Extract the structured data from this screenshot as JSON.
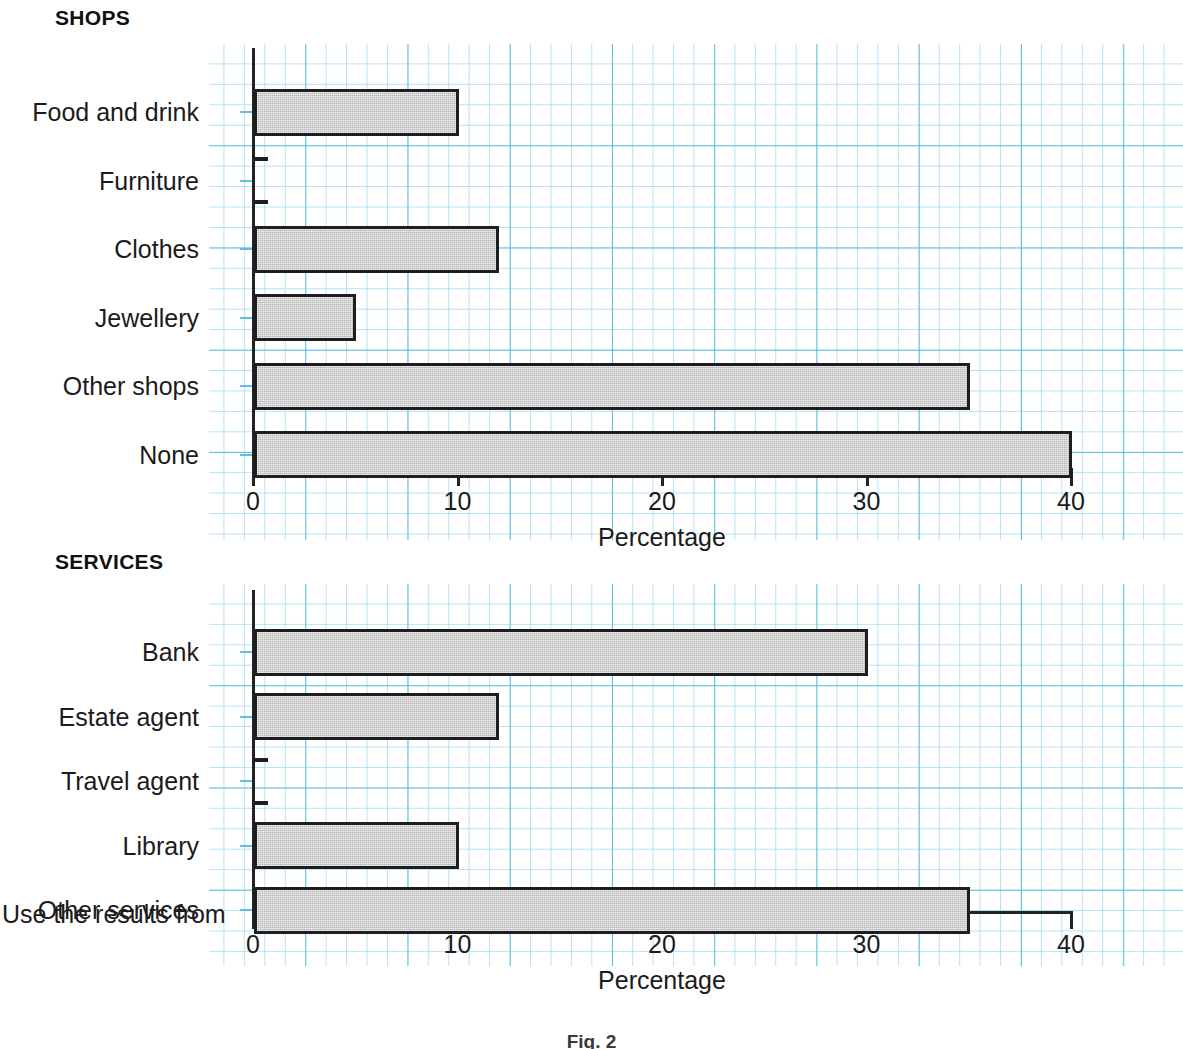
{
  "figure": {
    "caption": "Fig. 2",
    "stray_text": "Use the results from"
  },
  "shops": {
    "title": "SHOPS",
    "axis_caption": "Percentage"
  },
  "services": {
    "title": "SERVICES",
    "axis_caption": "Percentage"
  },
  "chart_data": [
    {
      "type": "bar",
      "orientation": "horizontal",
      "title": "SHOPS",
      "xlabel": "Percentage",
      "ylabel": "",
      "xlim": [
        0,
        45
      ],
      "xticks": [
        0,
        10,
        20,
        30,
        40
      ],
      "xticklabels": [
        "0",
        "10",
        "20",
        "30",
        "40"
      ],
      "grid": true,
      "grid_minor_step": 1,
      "grid_major_step": 5,
      "legend": "none",
      "bar_fill": "#c9c9c9",
      "bar_edge": "#1e1e1e",
      "categories": [
        "Food and drink",
        "Furniture",
        "Clothes",
        "Jewellery",
        "Other shops",
        "None"
      ],
      "values": [
        10,
        0.5,
        12,
        5,
        35,
        40
      ]
    },
    {
      "type": "bar",
      "orientation": "horizontal",
      "title": "SERVICES",
      "xlabel": "Percentage",
      "ylabel": "",
      "xlim": [
        0,
        45
      ],
      "xticks": [
        0,
        10,
        20,
        30,
        40
      ],
      "xticklabels": [
        "0",
        "10",
        "20",
        "30",
        "40"
      ],
      "grid": true,
      "grid_minor_step": 1,
      "grid_major_step": 5,
      "legend": "none",
      "bar_fill": "#c9c9c9",
      "bar_edge": "#1e1e1e",
      "categories": [
        "Bank",
        "Estate agent",
        "Travel agent",
        "Library",
        "Other services"
      ],
      "values": [
        30,
        12,
        0.5,
        10,
        35
      ]
    }
  ],
  "colors": {
    "grid_major": "#50b9e1",
    "grid_minor": "#96d7f0",
    "axis": "#222222",
    "bar_fill": "#c9c9c9",
    "bar_edge": "#1e1e1e",
    "text": "#1b1b1b"
  }
}
